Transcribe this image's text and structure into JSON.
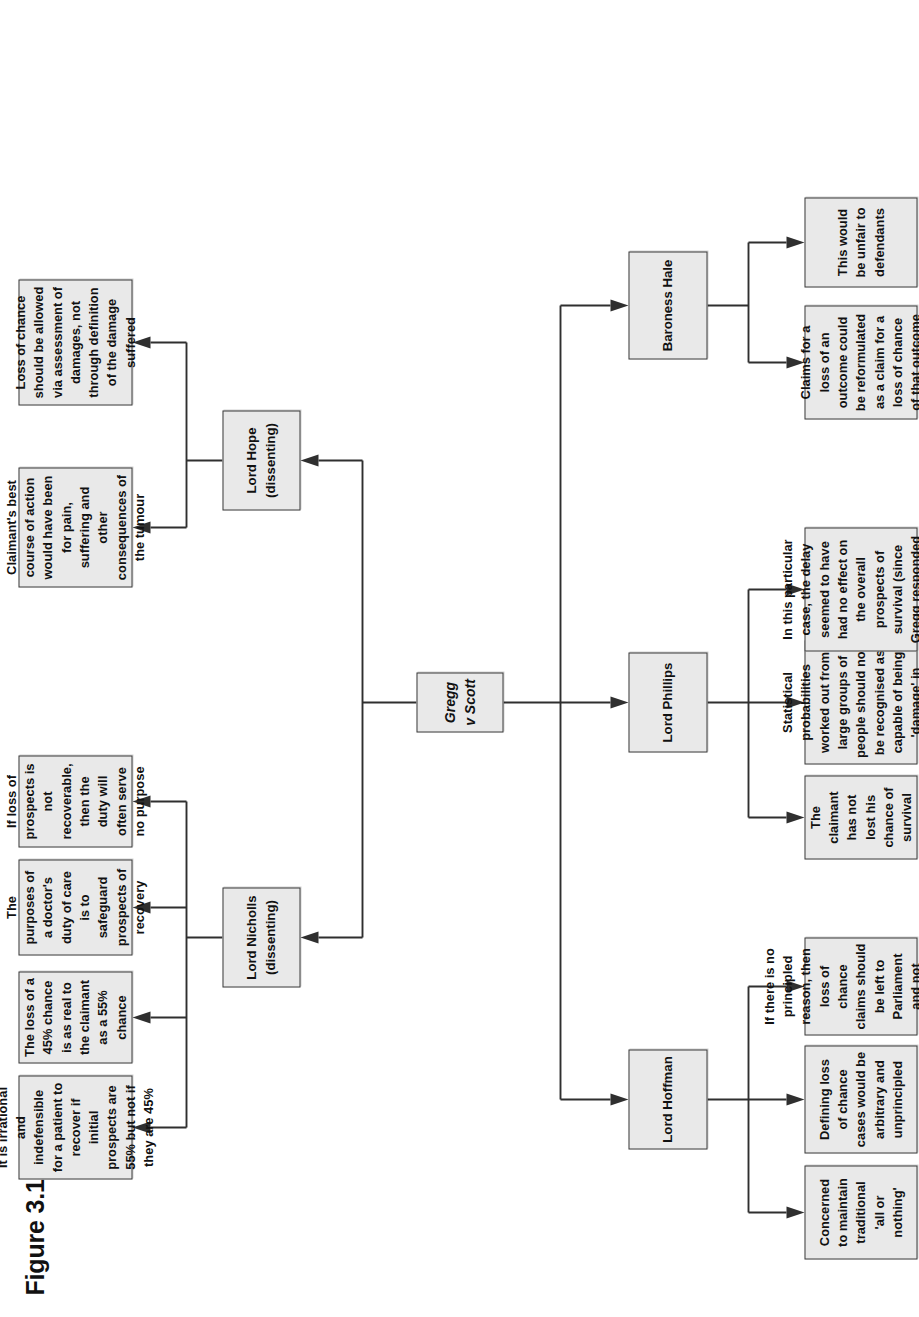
{
  "figure": {
    "title": "Figure 3.1",
    "orientation": "rotated-90-ccw",
    "style": {
      "box_fill": "#e9e9e9",
      "box_border": "#3a3a3a",
      "connector": "#2f2f2f",
      "page_background": "#ffffff",
      "text": "#111111"
    }
  },
  "root": {
    "label": "Gregg v Scott",
    "italic": true
  },
  "branches": {
    "majority": [
      {
        "name": "lord-hoffman",
        "label": "Lord Hoffman",
        "points": [
          "Concerned to maintain traditional 'all or nothing'",
          "Defining loss of chance cases would be arbitrary and unprincipled",
          "If there is no principled reason, then loss of chance claims should be left to Parliament and not attempted by common law"
        ]
      },
      {
        "name": "lord-phillips",
        "label": "Lord Phillips",
        "points": [
          "The claimant has not lost his chance of survival",
          "Statistical probabilities worked out from large groups of people should not be recognised as capable of being 'damage' in negligence cases",
          "In this particular case, the delay seemed to have had no effect on the overall prospects of survival (since Gregg responded well to treatment)"
        ]
      },
      {
        "name": "baroness-hale",
        "label": "Baroness Hale",
        "points": [
          "Claims for a loss of an outcome could be reformulated as a claim for a loss of chance of that outcome",
          "This would be unfair to defendants"
        ]
      }
    ],
    "dissenting": [
      {
        "name": "lord-nicholls",
        "label": "Lord Nicholls (dissenting)",
        "points": [
          "It is irrational and indefensible for a patient to recover if initial prospects are 55% but not if they are 45%",
          "The loss of a 45% chance is as real to the claimant as a 55% chance",
          "The purposes of a doctor's duty of care is to safeguard prospects of recovery",
          "If loss of prospects is not recoverable, then the duty will often serve no purpose"
        ]
      },
      {
        "name": "lord-hope",
        "label": "Lord Hope (dissenting)",
        "points": [
          "Claimant's best course of action would have been for pain, suffering and other consequences of the tumour",
          "Loss of chance should be allowed via assessment of damages, not through definition of the damage suffered"
        ]
      }
    ]
  }
}
